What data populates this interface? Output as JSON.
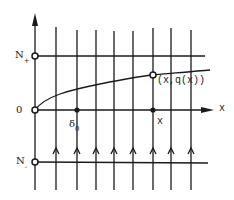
{
  "diagram": {
    "colors": {
      "ink": "#1a1a1a",
      "background": "#ffffff"
    },
    "labels": {
      "n_plus_main": "N",
      "n_plus_sub": "+",
      "zero": "0",
      "n_minus_main": "N",
      "n_minus_sub": "-",
      "delta_main": "δ",
      "delta_sub": "0",
      "x_point": "x",
      "x_axis": "x",
      "curve_point": "(x,q(x))"
    },
    "levels": [
      "N+",
      "0",
      "N-"
    ],
    "marked_points": [
      "δ0",
      "x",
      "(x,q(x))"
    ],
    "vertical_line_count": 8,
    "flow_direction": "upward"
  }
}
